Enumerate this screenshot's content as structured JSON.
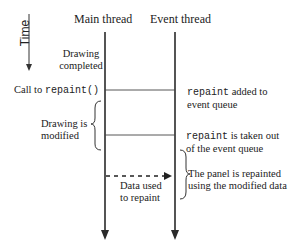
{
  "diagram": {
    "time_axis": {
      "label": "Time"
    },
    "lanes": [
      {
        "id": "main",
        "label": "Main thread"
      },
      {
        "id": "event",
        "label": "Event thread"
      }
    ],
    "main_labels": {
      "drawing_completed_1": "Drawing",
      "drawing_completed_2": "completed",
      "call_to": "Call to ",
      "call_code": "repaint()",
      "drawing_modified_1": "Drawing is",
      "drawing_modified_2": "modified",
      "data_used_1": "Data used",
      "data_used_2": "to repaint"
    },
    "event_labels": {
      "added_code": "repaint",
      "added_text": " added to",
      "added_text_2": "event queue",
      "taken_code": "repaint",
      "taken_text": " is taken out",
      "taken_text_2": "of the event queue",
      "repainted_1": "The panel is repainted",
      "repainted_2": "using the modified data"
    },
    "colors": {
      "line": "#2a2a2a",
      "text": "#222222",
      "background": "#ffffff"
    }
  }
}
